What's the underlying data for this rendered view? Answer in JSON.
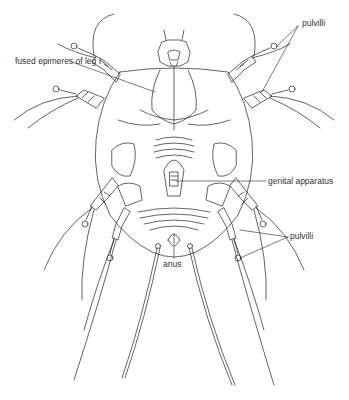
{
  "figure": {
    "colors": {
      "line": "#222222",
      "background": "#ffffff",
      "label": "#333333"
    },
    "labels": [
      {
        "id": "fused-epimeres",
        "text": "fused epimeres of leg I",
        "x": 15,
        "y": 61
      },
      {
        "id": "pulvilli-top",
        "text": "pulvilli",
        "x": 302,
        "y": 23
      },
      {
        "id": "genital-apparatus",
        "text": "genital apparatus",
        "x": 268,
        "y": 181
      },
      {
        "id": "pulvilli-bottom",
        "text": "pulvilli",
        "x": 290,
        "y": 235
      },
      {
        "id": "anus",
        "text": "anus",
        "x": 162,
        "y": 262
      }
    ]
  }
}
